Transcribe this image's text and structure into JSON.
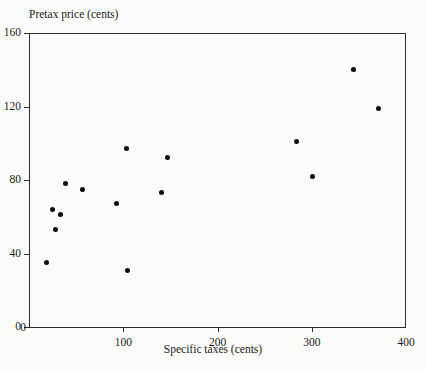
{
  "chart_data": {
    "type": "scatter",
    "title": "",
    "xlabel": "Specific taxes (cents)",
    "ylabel": "Pretax price (cents)",
    "xlim": [
      0,
      400
    ],
    "ylim": [
      0,
      160
    ],
    "xticks": [
      0,
      100,
      200,
      300,
      400
    ],
    "yticks": [
      0,
      40,
      80,
      120,
      160
    ],
    "xtick_labels": [
      "0",
      "100",
      "200",
      "300",
      "400"
    ],
    "ytick_labels": [
      "0",
      "40",
      "80",
      "120",
      "160"
    ],
    "grid": false,
    "legend": null,
    "marker": "filled-circle",
    "marker_color": "#0b0b0b",
    "points": [
      {
        "x": 19,
        "y": 35
      },
      {
        "x": 25,
        "y": 64
      },
      {
        "x": 28,
        "y": 53
      },
      {
        "x": 33,
        "y": 61
      },
      {
        "x": 39,
        "y": 78
      },
      {
        "x": 57,
        "y": 75
      },
      {
        "x": 93,
        "y": 67
      },
      {
        "x": 103,
        "y": 97
      },
      {
        "x": 105,
        "y": 31
      },
      {
        "x": 141,
        "y": 73
      },
      {
        "x": 147,
        "y": 92
      },
      {
        "x": 284,
        "y": 101
      },
      {
        "x": 301,
        "y": 82
      },
      {
        "x": 344,
        "y": 140
      },
      {
        "x": 371,
        "y": 119
      }
    ]
  },
  "axes": {
    "y_title": "Pretax price (cents)",
    "x_title": "Specific taxes (cents)"
  },
  "colors": {
    "background": "#fbfbfa",
    "axis": "#2b2b2b",
    "text": "#1a1a1a",
    "marker": "#0b0b0b"
  }
}
